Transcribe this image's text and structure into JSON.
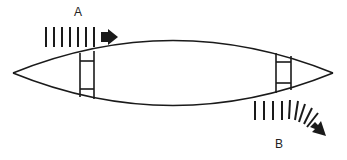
{
  "diagram": {
    "labels": {
      "a": "A",
      "b": "B"
    },
    "colors": {
      "stroke": "#1a1a1a",
      "fill": "#1a1a1a",
      "background": "#ffffff"
    },
    "elements": [
      {
        "name": "lens-body",
        "shape": "lens",
        "description": "Elongated lens/boat-shaped outline"
      },
      {
        "name": "left-frame",
        "shape": "ladder-bracket",
        "description": "Vertical frame with two rungs near left end"
      },
      {
        "name": "right-frame",
        "shape": "ladder-bracket",
        "description": "Vertical frame with two rungs near right end"
      },
      {
        "name": "flow-a",
        "shape": "dashed-straight-arrow",
        "direction": "right",
        "label": "A"
      },
      {
        "name": "flow-b",
        "shape": "dashed-curved-arrow",
        "direction": "down-right",
        "label": "B"
      }
    ]
  }
}
